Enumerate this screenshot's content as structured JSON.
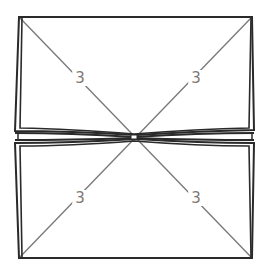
{
  "diagram": {
    "colors": {
      "outline": "#2a2a2a",
      "diagonal": "#777777",
      "label": "#7a7a7a",
      "background": "#ffffff"
    },
    "labels": [
      {
        "text": "3",
        "position": "top-left-diagonal",
        "x": 80,
        "y": 78
      },
      {
        "text": "3",
        "position": "top-right-diagonal",
        "x": 196,
        "y": 78
      },
      {
        "text": "3",
        "position": "bottom-left-diagonal",
        "x": 80,
        "y": 198
      },
      {
        "text": "3",
        "position": "bottom-right-diagonal",
        "x": 196,
        "y": 198
      }
    ],
    "center": {
      "x": 134,
      "y": 137
    }
  }
}
